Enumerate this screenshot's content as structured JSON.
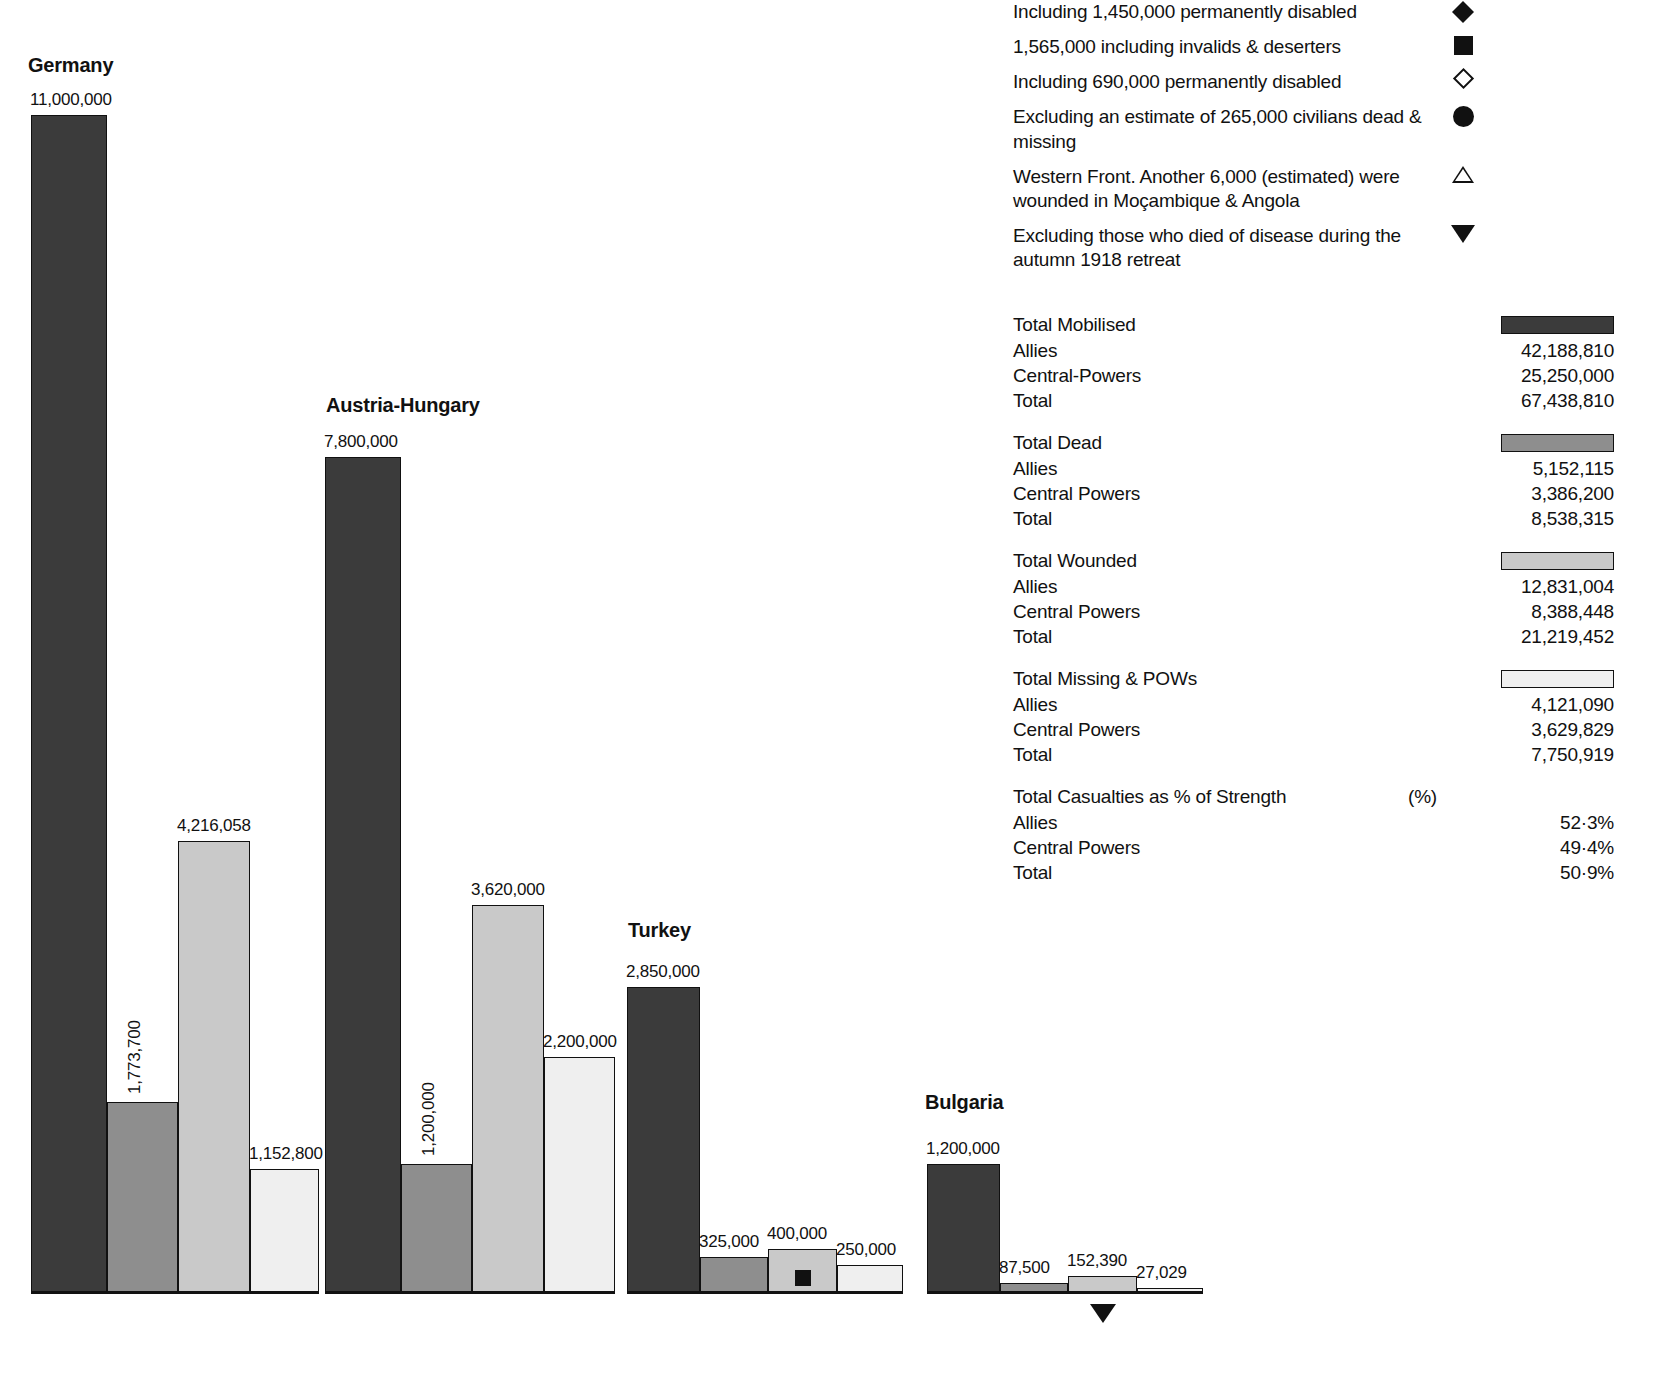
{
  "chart_data": {
    "type": "bar",
    "title": "",
    "xlabel": "",
    "ylabel": "",
    "series_names": [
      "Total Mobilised",
      "Total Dead",
      "Total Wounded",
      "Total Missing & POWs"
    ],
    "categories": [
      "Germany",
      "Austria-Hungary",
      "Turkey",
      "Bulgaria"
    ],
    "groups": [
      {
        "name": "Germany",
        "bars": [
          {
            "series": "Total Mobilised",
            "value": 11000000,
            "label": "11,000,000",
            "shade": "s0",
            "label_orientation": "horizontal",
            "marker": ""
          },
          {
            "series": "Total Dead",
            "value": 1773700,
            "label": "1,773,700",
            "shade": "s1",
            "label_orientation": "vertical",
            "marker": ""
          },
          {
            "series": "Total Wounded",
            "value": 4216058,
            "label": "4,216,058",
            "shade": "s2",
            "label_orientation": "horizontal",
            "marker": ""
          },
          {
            "series": "Total Missing & POWs",
            "value": 1152800,
            "label": "1,152,800",
            "shade": "s3",
            "label_orientation": "horizontal",
            "marker": ""
          }
        ]
      },
      {
        "name": "Austria-Hungary",
        "bars": [
          {
            "series": "Total Mobilised",
            "value": 7800000,
            "label": "7,800,000",
            "shade": "s0",
            "label_orientation": "horizontal",
            "marker": ""
          },
          {
            "series": "Total Dead",
            "value": 1200000,
            "label": "1,200,000",
            "shade": "s1",
            "label_orientation": "vertical",
            "marker": ""
          },
          {
            "series": "Total Wounded",
            "value": 3620000,
            "label": "3,620,000",
            "shade": "s2",
            "label_orientation": "horizontal",
            "marker": ""
          },
          {
            "series": "Total Missing & POWs",
            "value": 2200000,
            "label": "2,200,000",
            "shade": "s3",
            "label_orientation": "horizontal",
            "marker": ""
          }
        ]
      },
      {
        "name": "Turkey",
        "bars": [
          {
            "series": "Total Mobilised",
            "value": 2850000,
            "label": "2,850,000",
            "shade": "s0",
            "label_orientation": "horizontal",
            "marker": ""
          },
          {
            "series": "Total Dead",
            "value": 325000,
            "label": "325,000",
            "shade": "s1",
            "label_orientation": "horizontal",
            "marker": ""
          },
          {
            "series": "Total Wounded",
            "value": 400000,
            "label": "400,000",
            "shade": "s2",
            "label_orientation": "horizontal",
            "marker": "square-filled"
          },
          {
            "series": "Total Missing & POWs",
            "value": 250000,
            "label": "250,000",
            "shade": "s3",
            "label_orientation": "horizontal",
            "marker": ""
          }
        ]
      },
      {
        "name": "Bulgaria",
        "bars": [
          {
            "series": "Total Mobilised",
            "value": 1200000,
            "label": "1,200,000",
            "shade": "s0",
            "label_orientation": "horizontal",
            "marker": ""
          },
          {
            "series": "Total Dead",
            "value": 87500,
            "label": "87,500",
            "shade": "s1",
            "label_orientation": "horizontal",
            "marker": ""
          },
          {
            "series": "Total Wounded",
            "value": 152390,
            "label": "152,390",
            "shade": "s2",
            "label_orientation": "horizontal",
            "marker": "triangle-down"
          },
          {
            "series": "Total Missing & POWs",
            "value": 27029,
            "label": "27,029",
            "shade": "s3",
            "label_orientation": "horizontal",
            "marker": ""
          }
        ]
      }
    ],
    "ylim": [
      0,
      11000000
    ],
    "grid": false,
    "legend_position": "right"
  },
  "footnotes": [
    {
      "text": "Including 1,450,000 permanently disabled",
      "symbol": "diamond-filled"
    },
    {
      "text": "1,565,000 including invalids & deserters",
      "symbol": "square-filled"
    },
    {
      "text": "Including 690,000 permanently disabled",
      "symbol": "diamond-open"
    },
    {
      "text": "Excluding an estimate of 265,000 civilians dead & missing",
      "symbol": "circle-filled"
    },
    {
      "text": "Western Front. Another 6,000 (estimated) were wounded in Moçambique & Angola",
      "symbol": "triangle-open"
    },
    {
      "text": "Excluding those who died of disease during the autumn 1918 retreat",
      "symbol": "triangle-down"
    }
  ],
  "summary": [
    {
      "heading": "Total Mobilised",
      "swatch": "s0",
      "rows": [
        {
          "label": "Allies",
          "value": "42,188,810"
        },
        {
          "label": "Central-Powers",
          "value": "25,250,000"
        },
        {
          "label": "Total",
          "value": "67,438,810"
        }
      ]
    },
    {
      "heading": "Total Dead",
      "swatch": "s1",
      "rows": [
        {
          "label": "Allies",
          "value": "5,152,115"
        },
        {
          "label": "Central Powers",
          "value": "3,386,200"
        },
        {
          "label": "Total",
          "value": "8,538,315"
        }
      ]
    },
    {
      "heading": "Total Wounded",
      "swatch": "s2",
      "rows": [
        {
          "label": "Allies",
          "value": "12,831,004"
        },
        {
          "label": "Central Powers",
          "value": "8,388,448"
        },
        {
          "label": "Total",
          "value": "21,219,452"
        }
      ]
    },
    {
      "heading": "Total Missing & POWs",
      "swatch": "s3",
      "rows": [
        {
          "label": "Allies",
          "value": "4,121,090"
        },
        {
          "label": "Central Powers",
          "value": "3,629,829"
        },
        {
          "label": "Total",
          "value": "7,750,919"
        }
      ]
    },
    {
      "heading": "Total Casualties as % of Strength",
      "swatch": "",
      "unit": "(%)",
      "rows": [
        {
          "label": "Allies",
          "value": "52·3%"
        },
        {
          "label": "Central Powers",
          "value": "49·4%"
        },
        {
          "label": "Total",
          "value": "50·9%"
        }
      ]
    }
  ],
  "colors": {
    "mobilised": "#3b3b3b",
    "dead": "#8e8e8e",
    "wounded": "#c9c9c9",
    "missing": "#efefef",
    "ink": "#111111"
  }
}
